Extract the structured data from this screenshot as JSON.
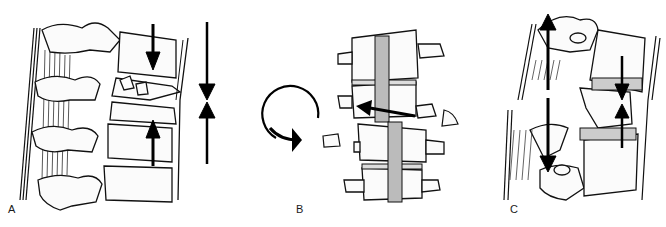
{
  "figure": {
    "panels": [
      {
        "id": "A",
        "label": "A",
        "mechanism": "axial compression",
        "arrows": [
          "down",
          "up",
          "converging-pair"
        ]
      },
      {
        "id": "B",
        "label": "B",
        "mechanism": "rotation / translation",
        "arrows": [
          "clockwise-rotation",
          "left-translation"
        ]
      },
      {
        "id": "C",
        "label": "C",
        "mechanism": "distraction / flexion",
        "arrows": [
          "up",
          "down",
          "converging-pair"
        ]
      }
    ],
    "colors": {
      "ink": "#111111",
      "background": "#ffffff",
      "fill": "#f4f4f4"
    }
  }
}
